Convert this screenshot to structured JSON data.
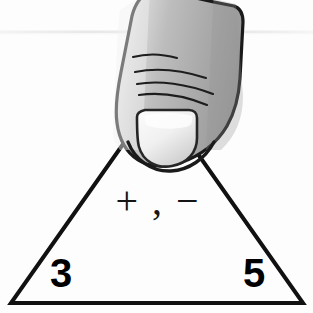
{
  "card": {
    "type": "fact-family-triangle-flashcard",
    "title": "Addition and subtraction fact triangle",
    "background_color": "#fdfdfd",
    "outline_color": "#111111",
    "shape": "triangle"
  },
  "triangle": {
    "name": "fact-triangle",
    "apex_label": "",
    "apex_hidden": true,
    "operators_label": "+ , −",
    "corner_values": {
      "bottom_left": "3",
      "bottom_right": "5",
      "top": ""
    },
    "geometry": {
      "apex_x": 157,
      "apex_y": 96,
      "left_x": 11,
      "left_y": 303,
      "right_x": 303,
      "right_y": 303,
      "stroke_width": 4
    }
  },
  "operators": {
    "plus_symbol": "+",
    "separator": ",",
    "minus_symbol": "−",
    "combined": "+ , −"
  },
  "numbers": [
    {
      "name": "bottom-left-number",
      "value": "3",
      "position": "bottom-left"
    },
    {
      "name": "bottom-right-number",
      "value": "5",
      "position": "bottom-right"
    }
  ],
  "thumb": {
    "name": "thumb-covering-apex",
    "description": "A hand's thumb pressing down over the top number of the triangle",
    "fill_light": "#e6e6e6",
    "fill_mid": "#b5b5b5",
    "fill_dark": "#8e8e8e",
    "outline_color": "#1a1a1a",
    "nail_light": "#f6f6f6",
    "nail_shadow": "#cfcfcf",
    "knuckle_line_count": 4
  },
  "artifacts": {
    "scan_line": {
      "name": "scan-line-artifact",
      "y": 32,
      "color": "#e9e9e9",
      "visible": true
    }
  },
  "colors": {
    "background": "#fdfdfd",
    "ink": "#000000",
    "skin_mid": "#b5b5b5",
    "skin_light": "#e6e6e6",
    "skin_dark": "#8e8e8e"
  }
}
